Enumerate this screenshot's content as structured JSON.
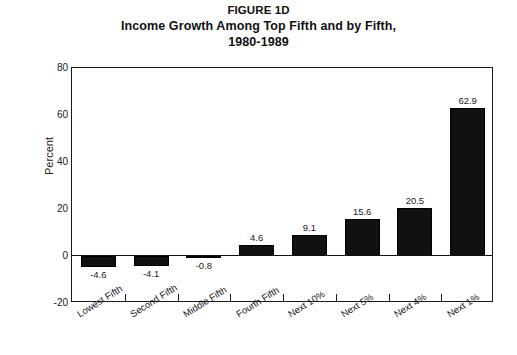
{
  "figure": {
    "title_lines": [
      "FIGURE 1D",
      "Income Growth Among Top Fifth and by Fifth,",
      "1980-1989"
    ],
    "background_color": "#ffffff",
    "bar_color": "#111111",
    "axis_color": "#1a1a1a"
  },
  "chart_data": {
    "type": "bar",
    "title": "FIGURE 1D Income Growth Among Top Fifth and by Fifth, 1980-1989",
    "subtitle": "1980-1989",
    "categories": [
      "Lowest Fifth",
      "Second Fifth",
      "Middle Fifth",
      "Fourth Fifth",
      "Next 10%",
      "Next 5%",
      "Next 4%",
      "Next 1%"
    ],
    "values": [
      -4.6,
      -4.1,
      -0.8,
      4.6,
      9.1,
      15.6,
      20.5,
      62.9
    ],
    "value_labels": [
      "-4.6",
      "-4.1",
      "-0.8",
      "4.6",
      "9.1",
      "15.6",
      "20.5",
      "62.9"
    ],
    "xlabel": "",
    "ylabel": "Percent",
    "ylim": [
      -20,
      80
    ],
    "yticks": [
      -20,
      0,
      20,
      40,
      60,
      80
    ],
    "ytick_labels": [
      "-20",
      "0",
      "20",
      "40",
      "60",
      "80"
    ],
    "grid": false,
    "legend": null,
    "series_color": "#111111"
  }
}
